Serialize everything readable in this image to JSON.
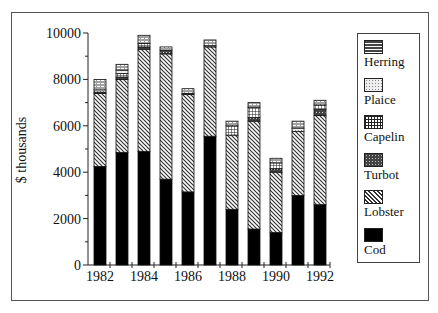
{
  "chart_data": {
    "type": "bar",
    "stacked": true,
    "title": "",
    "xlabel": "",
    "ylabel": "$ thousands",
    "ylim": [
      0,
      10000
    ],
    "yticks": [
      0,
      2000,
      4000,
      6000,
      8000,
      10000
    ],
    "ytick_labels": [
      "0",
      "2000",
      "4000",
      "6000",
      "8000",
      "10000"
    ],
    "xtick_labels": [
      "1982",
      "1984",
      "1986",
      "1988",
      "1990",
      "1992"
    ],
    "categories": [
      "1982",
      "1983",
      "1984",
      "1985",
      "1986",
      "1987",
      "1988",
      "1989",
      "1990",
      "1991",
      "1992"
    ],
    "grid": false,
    "legend_position": "right",
    "series": [
      {
        "name": "Cod",
        "pattern": "solid",
        "values": [
          4250,
          4850,
          4900,
          3700,
          3150,
          5550,
          2400,
          1550,
          1400,
          3000,
          2600
        ]
      },
      {
        "name": "Lobster",
        "pattern": "diagonal",
        "values": [
          3150,
          3150,
          4400,
          5400,
          4200,
          3850,
          3200,
          4650,
          2600,
          2750,
          3850
        ]
      },
      {
        "name": "Turbot",
        "pattern": "dark-dots",
        "values": [
          50,
          100,
          100,
          150,
          50,
          0,
          0,
          150,
          150,
          0,
          250
        ]
      },
      {
        "name": "Capelin",
        "pattern": "grid",
        "values": [
          0,
          150,
          150,
          0,
          0,
          0,
          400,
          450,
          250,
          0,
          200
        ]
      },
      {
        "name": "Plaice",
        "pattern": "light-dots",
        "values": [
          100,
          150,
          0,
          0,
          0,
          50,
          0,
          0,
          0,
          150,
          0
        ]
      },
      {
        "name": "Herring",
        "pattern": "hlines",
        "values": [
          450,
          250,
          350,
          150,
          200,
          250,
          200,
          200,
          200,
          300,
          200
        ]
      }
    ],
    "totals": [
      8000,
      8650,
      9900,
      9400,
      7600,
      9700,
      6200,
      7000,
      4600,
      6200,
      7100
    ]
  },
  "legend": {
    "items": [
      {
        "label": "Herring",
        "pattern": "hlines"
      },
      {
        "label": "Plaice",
        "pattern": "light-dots"
      },
      {
        "label": "Capelin",
        "pattern": "grid"
      },
      {
        "label": "Turbot",
        "pattern": "dark-dots"
      },
      {
        "label": "Lobster",
        "pattern": "diagonal"
      },
      {
        "label": "Cod",
        "pattern": "solid"
      }
    ]
  },
  "axis": {
    "ylabel": "$ thousands"
  }
}
